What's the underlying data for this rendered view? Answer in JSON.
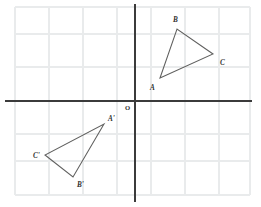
{
  "figure": {
    "width": 261,
    "height": 207,
    "background_color": "#ffffff"
  },
  "grid": {
    "line_color": "#e9ebec",
    "spacing_px": 34,
    "left_px": 15,
    "right_px": 250,
    "top_px": 7,
    "bottom_px": 195,
    "vertical_lines_px": [
      15,
      49,
      83,
      117,
      151,
      185,
      219,
      250
    ],
    "horizontal_lines_px": [
      7,
      34,
      67,
      101,
      134,
      161,
      195
    ]
  },
  "axes": {
    "color": "#3b3b3b",
    "origin_label": "O",
    "origin_px": {
      "x": 135,
      "y": 101
    },
    "x_axis": {
      "y_px": 101,
      "x_start_px": 5,
      "x_end_px": 252
    },
    "y_axis": {
      "x_px": 135,
      "y_start_px": 4,
      "y_end_px": 202
    }
  },
  "shapes": [
    {
      "name": "triangle-abc",
      "type": "triangle",
      "quadrant": "I",
      "stroke_color": "#60605f",
      "fill": "none",
      "vertices": [
        {
          "label": "A",
          "x_px": 160,
          "y_px": 78,
          "label_x_px": 150,
          "label_y_px": 90
        },
        {
          "label": "B",
          "x_px": 177,
          "y_px": 29,
          "label_x_px": 173,
          "label_y_px": 22
        },
        {
          "label": "C",
          "x_px": 213,
          "y_px": 54,
          "label_x_px": 220,
          "label_y_px": 65
        }
      ]
    },
    {
      "name": "triangle-a-prime-b-prime-c-prime",
      "type": "triangle",
      "quadrant": "III",
      "stroke_color": "#60605f",
      "fill": "none",
      "vertices": [
        {
          "label": "A'",
          "x_px": 104,
          "y_px": 124,
          "label_x_px": 108,
          "label_y_px": 121
        },
        {
          "label": "B'",
          "x_px": 73,
          "y_px": 177,
          "label_x_px": 77,
          "label_y_px": 187
        },
        {
          "label": "C'",
          "x_px": 45,
          "y_px": 155,
          "label_x_px": 33,
          "label_y_px": 158
        }
      ]
    }
  ],
  "labels": {
    "A": "A",
    "B": "B",
    "C": "C",
    "A_prime": "A'",
    "B_prime": "B'",
    "C_prime": "C'",
    "origin": "O"
  }
}
